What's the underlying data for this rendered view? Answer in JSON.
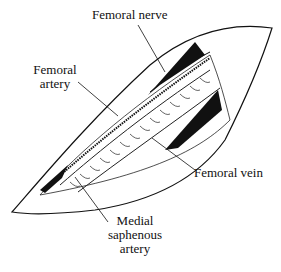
{
  "figure": {
    "type": "anatomical illustration",
    "labels": {
      "femoral_nerve": "Femoral nerve",
      "femoral_artery_line1": "Femoral",
      "femoral_artery_line2": "artery",
      "femoral_vein": "Femoral vein",
      "medial_saphenous_line1": "Medial",
      "medial_saphenous_line2": "saphenous",
      "medial_saphenous_line3": "artery"
    },
    "caption_fragment": "",
    "colors": {
      "ink": "#111111",
      "background": "#ffffff"
    }
  }
}
